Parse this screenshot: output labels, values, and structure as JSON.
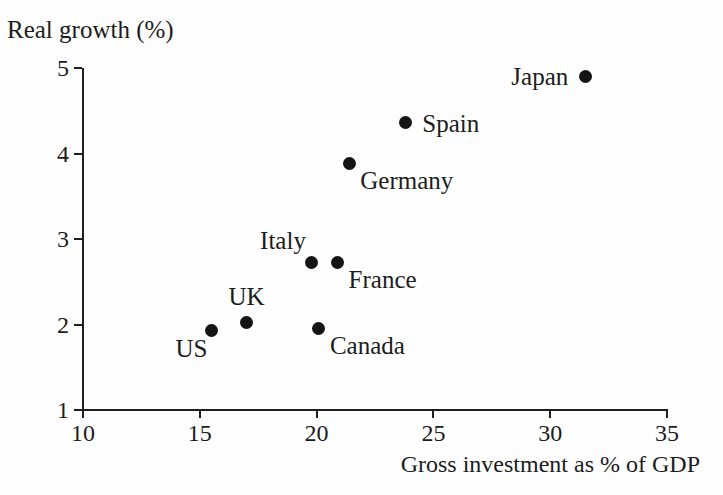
{
  "chart_data": {
    "type": "scatter",
    "title": "",
    "ylabel": "Real growth (%)",
    "xlabel": "Gross investment as % of GDP",
    "xlim": [
      10,
      35
    ],
    "ylim": [
      1,
      5
    ],
    "x_ticks": [
      10,
      15,
      20,
      25,
      30,
      35
    ],
    "y_ticks": [
      1,
      2,
      3,
      4,
      5
    ],
    "grid": false,
    "legend": false,
    "dot_color": "#141414",
    "axis_color": "#1f1f1f",
    "background_color": "#fefefe",
    "points": [
      {
        "label": "US",
        "x": 15.5,
        "y": 1.93,
        "label_pos": "below-left"
      },
      {
        "label": "UK",
        "x": 17.0,
        "y": 2.02,
        "label_pos": "above"
      },
      {
        "label": "Canada",
        "x": 20.1,
        "y": 1.95,
        "label_pos": "below-right"
      },
      {
        "label": "Italy",
        "x": 19.8,
        "y": 2.73,
        "label_pos": "above-left"
      },
      {
        "label": "France",
        "x": 20.9,
        "y": 2.72,
        "label_pos": "below-right"
      },
      {
        "label": "Germany",
        "x": 21.4,
        "y": 3.88,
        "label_pos": "below-right"
      },
      {
        "label": "Spain",
        "x": 23.8,
        "y": 4.36,
        "label_pos": "right"
      },
      {
        "label": "Japan",
        "x": 31.5,
        "y": 4.9,
        "label_pos": "left"
      }
    ]
  }
}
